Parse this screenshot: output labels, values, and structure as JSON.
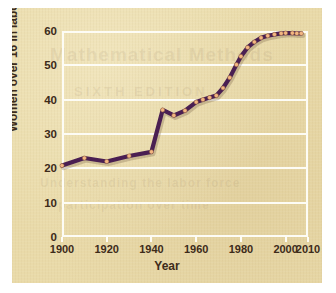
{
  "chart_data": {
    "type": "line",
    "title": "",
    "xlabel": "Year",
    "ylabel": "Women over 16 in labor force (%)",
    "xlim": [
      1900,
      2010
    ],
    "ylim": [
      0,
      60
    ],
    "grid": true,
    "legend": "none",
    "line_color": "#4a1f52",
    "marker_color": "#f2b храм080",
    "xticks": [
      1900,
      1920,
      1940,
      1960,
      1980,
      2000,
      2010
    ],
    "xtick_labels": [
      "1900",
      "1920",
      "1940",
      "1960",
      "1980",
      "2000",
      "2010"
    ],
    "yticks": [
      0,
      10,
      20,
      30,
      40,
      50,
      60
    ],
    "ytick_labels": [
      "0",
      "10",
      "20",
      "30",
      "40",
      "50",
      "60"
    ],
    "series": [
      {
        "name": "Women over 16 in labor force",
        "x": [
          1900,
          1910,
          1920,
          1930,
          1940,
          1945,
          1950,
          1955,
          1960,
          1963,
          1966,
          1969,
          1972,
          1975,
          1978,
          1980,
          1983,
          1986,
          1989,
          1992,
          1995,
          1998,
          2000,
          2003,
          2005,
          2007
        ],
        "values": [
          20.8,
          23.0,
          22.0,
          23.6,
          24.8,
          37.0,
          35.4,
          36.8,
          39.3,
          40.0,
          40.6,
          41.2,
          43.4,
          46.4,
          50.2,
          52.6,
          55.2,
          56.8,
          58.0,
          58.6,
          59.0,
          59.3,
          59.4,
          59.4,
          59.3,
          59.3
        ]
      }
    ]
  },
  "ghost_text": {
    "line1": "Mathematical Methods",
    "line2": "SIXTH EDITION",
    "line3": "Understanding the labor force",
    "line4": "participation over time"
  }
}
